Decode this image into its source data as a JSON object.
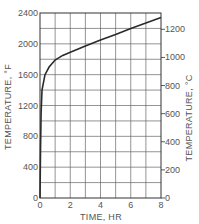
{
  "chart_data": {
    "type": "line",
    "title": "",
    "xlabel": "TIME, HR",
    "ylabel": "TEMPERATURE, °F",
    "ylabel_right": "TEMPERATURE, °C",
    "xlim": [
      0,
      8
    ],
    "ylim": [
      0,
      2400
    ],
    "ylim_right": [
      0,
      1316
    ],
    "grid": true,
    "x_ticks": [
      "0",
      "2",
      "4",
      "6",
      "8"
    ],
    "y_ticks": [
      "0",
      "400",
      "800",
      "1200",
      "1600",
      "2000",
      "2400"
    ],
    "y_ticks_right": [
      "0",
      "200",
      "400",
      "600",
      "800",
      "1000",
      "1200"
    ],
    "series": [
      {
        "name": "Temperature",
        "x": [
          0,
          0.03,
          0.07,
          0.13,
          0.33,
          0.6,
          1,
          1.5,
          2,
          3,
          4,
          5,
          6,
          7,
          8
        ],
        "y": [
          0,
          600,
          1100,
          1400,
          1600,
          1700,
          1790,
          1850,
          1890,
          1970,
          2050,
          2120,
          2200,
          2270,
          2340
        ]
      }
    ]
  }
}
